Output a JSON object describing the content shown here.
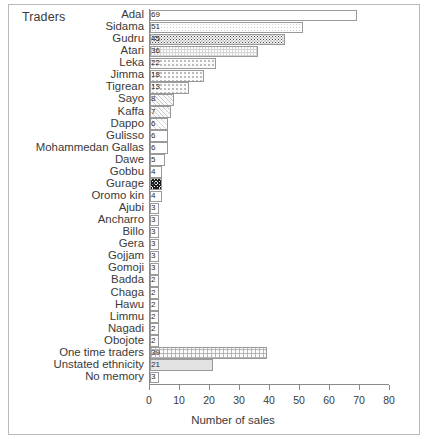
{
  "figure": {
    "y_axis_title": "Traders",
    "x_axis_title": "Number of sales"
  },
  "chart_data": {
    "type": "bar",
    "orientation": "horizontal",
    "title": "",
    "xlabel": "Number of sales",
    "ylabel": "Traders",
    "xlim": [
      0,
      80
    ],
    "xticks": [
      0,
      10,
      20,
      30,
      40,
      50,
      60,
      70,
      80
    ],
    "grid": false,
    "legend": "none",
    "categories": [
      "Adal",
      "Sidama",
      "Gudru",
      "Atari",
      "Leka",
      "Jimma",
      "Tigrean",
      "Sayo",
      "Kaffa",
      "Dappo",
      "Gulisso",
      "Mohammedan Gallas",
      "Dawe",
      "Gobbu",
      "Gurage",
      "Oromo kin",
      "Ajubi",
      "Ancharro",
      "Billo",
      "Gera",
      "Gojjam",
      "Gomoji",
      "Badda",
      "Chaga",
      "Hawu",
      "Limmu",
      "Nagadi",
      "Obojote",
      "One time traders",
      "Unstated ethnicity",
      "No memory"
    ],
    "values": [
      69,
      51,
      45,
      36,
      22,
      18,
      13,
      8,
      7,
      6,
      6,
      6,
      5,
      4,
      4,
      4,
      3,
      3,
      3,
      3,
      3,
      3,
      2,
      2,
      2,
      2,
      2,
      2,
      39,
      21,
      3
    ],
    "bar_patterns": [
      "plain",
      "lightdot",
      "speckle",
      "grid",
      "dot",
      "dot",
      "dot",
      "hatch",
      "hatch",
      "hatch-fine",
      "plain",
      "plain",
      "plain",
      "plain",
      "checker-dark",
      "plain",
      "plain",
      "plain",
      "plain",
      "plain",
      "plain",
      "plain",
      "plain",
      "plain",
      "plain",
      "plain",
      "plain",
      "plain",
      "checker",
      "solid-gray",
      "plain"
    ]
  }
}
